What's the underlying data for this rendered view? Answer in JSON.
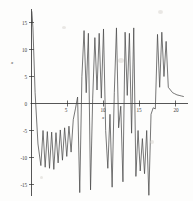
{
  "figure": {
    "name": "oscillatory-function-plot",
    "background_color": "#fdfdfc",
    "curve_color": "#4a4a4a",
    "axis_color": "#2b2b2b"
  },
  "chart_data": {
    "type": "line",
    "title": "",
    "subtitle": "",
    "xlabel": "x",
    "ylabel": "x",
    "xlim": [
      0,
      21.5
    ],
    "ylim": [
      -17.5,
      17.5
    ],
    "grid": false,
    "legend": null,
    "legend_position": "none",
    "x_ticks": [
      5,
      10,
      15,
      20
    ],
    "x_tick_labels": [
      "5",
      "10",
      "15",
      "20"
    ],
    "y_ticks": [
      -15,
      -10,
      -5,
      0,
      5,
      10,
      15
    ],
    "y_tick_labels": [
      "-15",
      "-10",
      "-5",
      "0",
      "5",
      "10",
      "15"
    ],
    "series": [
      {
        "name": "curve",
        "color": "#4a4a4a",
        "x": [
          0.05,
          0.2,
          0.5,
          0.9,
          1.3,
          1.6,
          1.9,
          2.2,
          2.5,
          2.8,
          3.1,
          3.4,
          3.7,
          4.0,
          4.3,
          4.6,
          4.9,
          5.2,
          5.5,
          5.8,
          6.1,
          6.4,
          6.7,
          7.0,
          7.3,
          7.6,
          7.9,
          8.2,
          8.5,
          8.8,
          9.1,
          9.4,
          9.7,
          10.0,
          10.3,
          10.6,
          10.9,
          11.2,
          11.5,
          11.8,
          12.1,
          12.4,
          12.7,
          13.0,
          13.3,
          13.6,
          13.9,
          14.2,
          14.5,
          14.8,
          15.1,
          15.4,
          15.7,
          16.0,
          16.3,
          16.6,
          16.9,
          17.2,
          17.5,
          17.8,
          18.1,
          18.4,
          18.7,
          19.0,
          19.3,
          19.6,
          19.9,
          20.2,
          20.5,
          20.8,
          21.1
        ],
        "y": [
          17.0,
          14.0,
          2.0,
          -7.5,
          -11.5,
          -5.0,
          -11.8,
          -5.2,
          -12.0,
          -5.3,
          -12.2,
          -5.4,
          -11.0,
          -4.9,
          -10.5,
          -4.5,
          -9.8,
          -4.2,
          -9.0,
          -3.0,
          -1.0,
          1.2,
          -16.5,
          5.0,
          13.5,
          2.0,
          13.0,
          -16.0,
          1.0,
          12.2,
          2.5,
          13.0,
          1.0,
          13.8,
          -5.0,
          -12.0,
          -2.0,
          -15.5,
          2.0,
          14.0,
          -4.5,
          -0.5,
          -14.5,
          13.2,
          1.5,
          13.0,
          -5.5,
          14.0,
          -13.5,
          -5.0,
          -12.5,
          -6.5,
          -13.0,
          -5.0,
          -17.0,
          -2.0,
          -0.8,
          -1.0,
          12.8,
          3.0,
          13.2,
          5.0,
          11.5,
          3.0,
          2.5,
          2.0,
          1.8,
          1.6,
          1.5,
          1.4,
          1.3
        ]
      }
    ]
  },
  "axes": {
    "x_axis_label": "x",
    "y_axis_label": "x"
  },
  "ticks": {
    "x": [
      {
        "value": 5,
        "label": "5"
      },
      {
        "value": 10,
        "label": "10"
      },
      {
        "value": 15,
        "label": "15"
      },
      {
        "value": 20,
        "label": "20"
      }
    ],
    "y": [
      {
        "value": 15,
        "label": "15"
      },
      {
        "value": 10,
        "label": "10"
      },
      {
        "value": 5,
        "label": "5"
      },
      {
        "value": 0,
        "label": "0"
      },
      {
        "value": -5,
        "label": "-5"
      },
      {
        "value": -10,
        "label": "-10"
      },
      {
        "value": -15,
        "label": "-15"
      }
    ]
  }
}
